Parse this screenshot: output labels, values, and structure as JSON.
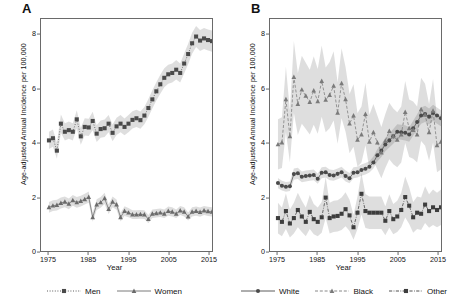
{
  "figure": {
    "panels": [
      {
        "id": "A",
        "label": "A",
        "xlabel": "Year",
        "ylabel": "Age-adjusted Annual Incidence per 100,000"
      },
      {
        "id": "B",
        "label": "B",
        "xlabel": "Year",
        "ylabel": "Age-adjusted Annual Incidence per 100,000"
      }
    ]
  },
  "legends": {
    "panel_a": [
      {
        "label": "Men",
        "marker": "square",
        "line": "dotted",
        "color": "#4a4a4a"
      },
      {
        "label": "Women",
        "marker": "triangle",
        "line": "solid",
        "color": "#6b6b6b"
      }
    ],
    "panel_b": [
      {
        "label": "White",
        "marker": "circle",
        "line": "solid",
        "color": "#4a4a4a"
      },
      {
        "label": "Black",
        "marker": "triangle",
        "line": "dashed",
        "color": "#7a7a7a"
      },
      {
        "label": "Other",
        "marker": "square",
        "line": "dash-dot",
        "color": "#3d3d3d"
      }
    ]
  },
  "chart_data": [
    {
      "type": "line",
      "panel": "A",
      "title": "A",
      "xlabel": "Year",
      "ylabel": "Age-adjusted Annual Incidence per 100,000",
      "xlim": [
        1973,
        2016
      ],
      "ylim": [
        0,
        8.6
      ],
      "xticks": [
        1975,
        1985,
        1995,
        2005,
        2015
      ],
      "yticks": [
        0,
        2,
        4,
        6,
        8
      ],
      "grid": false,
      "legend_position": "bottom",
      "x": [
        1975,
        1976,
        1977,
        1978,
        1979,
        1980,
        1981,
        1982,
        1983,
        1984,
        1985,
        1986,
        1987,
        1988,
        1989,
        1990,
        1991,
        1992,
        1993,
        1994,
        1995,
        1996,
        1997,
        1998,
        1999,
        2000,
        2001,
        2002,
        2003,
        2004,
        2005,
        2006,
        2007,
        2008,
        2009,
        2010,
        2011,
        2012,
        2013,
        2014,
        2015,
        2016
      ],
      "series": [
        {
          "name": "Men",
          "marker": "square",
          "line": "dotted",
          "color": "#4a4a4a",
          "values": [
            4.1,
            4.18,
            3.72,
            4.72,
            4.42,
            4.48,
            4.42,
            4.88,
            4.25,
            4.6,
            4.58,
            4.82,
            4.35,
            4.52,
            4.55,
            4.72,
            4.38,
            4.62,
            4.72,
            4.6,
            4.72,
            4.86,
            4.92,
            4.85,
            5.02,
            5.3,
            5.62,
            5.92,
            6.18,
            6.42,
            6.55,
            6.6,
            6.72,
            6.6,
            6.95,
            7.3,
            7.7,
            7.95,
            7.8,
            7.88,
            7.82,
            7.78
          ],
          "ci_lower": [
            3.78,
            3.86,
            3.42,
            4.38,
            4.1,
            4.16,
            4.1,
            4.54,
            3.94,
            4.28,
            4.26,
            4.48,
            4.04,
            4.2,
            4.23,
            4.4,
            4.07,
            4.3,
            4.4,
            4.29,
            4.4,
            4.54,
            4.6,
            4.53,
            4.7,
            4.97,
            5.28,
            5.58,
            5.83,
            6.07,
            6.2,
            6.25,
            6.36,
            6.25,
            6.58,
            6.92,
            7.31,
            7.56,
            7.41,
            7.49,
            7.43,
            7.39
          ],
          "ci_upper": [
            4.42,
            4.5,
            4.02,
            5.06,
            4.74,
            4.8,
            4.74,
            5.22,
            4.56,
            4.92,
            4.9,
            5.16,
            4.66,
            4.84,
            4.87,
            5.04,
            4.69,
            4.94,
            5.04,
            4.91,
            5.04,
            5.18,
            5.24,
            5.17,
            5.34,
            5.63,
            5.96,
            6.26,
            6.53,
            6.77,
            6.9,
            6.95,
            7.08,
            6.95,
            7.32,
            7.68,
            8.09,
            8.34,
            8.19,
            8.27,
            8.21,
            8.17
          ]
        },
        {
          "name": "Women",
          "marker": "triangle",
          "line": "solid",
          "color": "#6b6b6b",
          "values": [
            1.62,
            1.68,
            1.7,
            1.78,
            1.82,
            1.75,
            1.88,
            1.8,
            1.85,
            1.92,
            2.0,
            1.25,
            1.72,
            1.8,
            1.95,
            1.55,
            1.82,
            1.72,
            1.25,
            1.48,
            1.42,
            1.35,
            1.35,
            1.36,
            1.35,
            1.18,
            1.38,
            1.4,
            1.42,
            1.38,
            1.48,
            1.45,
            1.38,
            1.5,
            1.45,
            1.28,
            1.45,
            1.48,
            1.44,
            1.5,
            1.47,
            1.45
          ],
          "ci_lower": [
            1.42,
            1.48,
            1.5,
            1.58,
            1.62,
            1.55,
            1.68,
            1.6,
            1.65,
            1.72,
            1.79,
            1.08,
            1.52,
            1.6,
            1.74,
            1.37,
            1.62,
            1.53,
            1.09,
            1.3,
            1.25,
            1.19,
            1.19,
            1.2,
            1.19,
            1.03,
            1.22,
            1.24,
            1.26,
            1.22,
            1.31,
            1.28,
            1.22,
            1.33,
            1.28,
            1.13,
            1.28,
            1.31,
            1.27,
            1.33,
            1.3,
            1.28
          ],
          "ci_upper": [
            1.82,
            1.88,
            1.9,
            1.98,
            2.02,
            1.95,
            2.08,
            2.0,
            2.05,
            2.12,
            2.21,
            1.42,
            1.92,
            2.0,
            2.16,
            1.73,
            2.02,
            1.91,
            1.41,
            1.66,
            1.59,
            1.51,
            1.51,
            1.52,
            1.51,
            1.33,
            1.54,
            1.56,
            1.58,
            1.54,
            1.65,
            1.62,
            1.54,
            1.67,
            1.62,
            1.43,
            1.62,
            1.65,
            1.61,
            1.67,
            1.64,
            1.62
          ]
        }
      ]
    },
    {
      "type": "line",
      "panel": "B",
      "title": "B",
      "xlabel": "Year",
      "ylabel": "Age-adjusted Annual Incidence per 100,000",
      "xlim": [
        1973,
        2016
      ],
      "ylim": [
        0,
        8.6
      ],
      "xticks": [
        1975,
        1985,
        1995,
        2005,
        2015
      ],
      "yticks": [
        0,
        2,
        4,
        6,
        8
      ],
      "grid": false,
      "legend_position": "bottom",
      "x": [
        1975,
        1976,
        1977,
        1978,
        1979,
        1980,
        1981,
        1982,
        1983,
        1984,
        1985,
        1986,
        1987,
        1988,
        1989,
        1990,
        1991,
        1992,
        1993,
        1994,
        1995,
        1996,
        1997,
        1998,
        1999,
        2000,
        2001,
        2002,
        2003,
        2004,
        2005,
        2006,
        2007,
        2008,
        2009,
        2010,
        2011,
        2012,
        2013,
        2014,
        2015,
        2016
      ],
      "series": [
        {
          "name": "White",
          "marker": "circle",
          "line": "solid",
          "color": "#4a4a4a",
          "values": [
            2.52,
            2.42,
            2.38,
            2.4,
            2.85,
            2.88,
            2.75,
            2.78,
            2.8,
            2.82,
            2.68,
            2.9,
            2.92,
            2.82,
            2.8,
            2.86,
            2.92,
            2.78,
            2.7,
            2.9,
            2.92,
            3.0,
            3.05,
            3.12,
            3.28,
            3.55,
            3.72,
            3.95,
            4.1,
            4.25,
            4.42,
            4.4,
            4.38,
            4.32,
            4.55,
            4.78,
            5.02,
            5.08,
            4.98,
            5.12,
            5.02,
            4.92
          ],
          "ci_lower": [
            2.33,
            2.24,
            2.2,
            2.22,
            2.64,
            2.67,
            2.55,
            2.58,
            2.6,
            2.62,
            2.49,
            2.7,
            2.72,
            2.62,
            2.6,
            2.66,
            2.72,
            2.58,
            2.51,
            2.7,
            2.72,
            2.79,
            2.84,
            2.91,
            3.06,
            3.32,
            3.48,
            3.7,
            3.84,
            3.98,
            4.14,
            4.12,
            4.1,
            4.05,
            4.27,
            4.49,
            4.72,
            4.78,
            4.68,
            4.82,
            4.72,
            4.62
          ],
          "ci_upper": [
            2.71,
            2.6,
            2.56,
            2.58,
            3.06,
            3.09,
            2.95,
            2.98,
            3.0,
            3.02,
            2.87,
            3.1,
            3.12,
            3.02,
            3.0,
            3.06,
            3.12,
            2.98,
            2.89,
            3.1,
            3.12,
            3.21,
            3.26,
            3.33,
            3.5,
            3.78,
            3.96,
            4.2,
            4.36,
            4.52,
            4.7,
            4.68,
            4.66,
            4.59,
            4.83,
            5.07,
            5.32,
            5.38,
            5.28,
            5.42,
            5.32,
            5.22
          ]
        },
        {
          "name": "Black",
          "marker": "triangle",
          "line": "dashed",
          "color": "#7a7a7a",
          "values": [
            3.95,
            4.02,
            5.62,
            4.25,
            6.45,
            5.45,
            5.98,
            5.75,
            5.52,
            5.95,
            5.55,
            6.3,
            5.6,
            5.78,
            6.12,
            5.12,
            6.22,
            5.62,
            4.72,
            5.02,
            4.12,
            4.32,
            5.08,
            4.05,
            4.4,
            4.02,
            3.65,
            4.08,
            4.45,
            4.25,
            4.12,
            4.32,
            5.15,
            4.55,
            4.48,
            4.32,
            5.25,
            5.05,
            4.4,
            5.2,
            3.92,
            4.05
          ],
          "ci_lower": [
            3.02,
            3.08,
            4.4,
            3.28,
            5.12,
            4.3,
            4.72,
            4.52,
            4.32,
            4.68,
            4.35,
            4.98,
            4.4,
            4.55,
            4.84,
            3.98,
            4.92,
            4.42,
            3.62,
            3.86,
            3.12,
            3.28,
            3.92,
            3.05,
            3.35,
            3.02,
            2.7,
            3.08,
            3.4,
            3.22,
            3.1,
            3.28,
            4.0,
            3.48,
            3.42,
            3.28,
            4.08,
            3.9,
            3.35,
            4.02,
            2.92,
            3.02
          ],
          "ci_upper": [
            4.88,
            4.96,
            6.84,
            5.22,
            7.78,
            6.6,
            7.24,
            6.98,
            6.72,
            7.22,
            6.75,
            7.62,
            6.8,
            7.01,
            7.4,
            6.26,
            7.52,
            6.82,
            5.82,
            6.18,
            5.12,
            5.36,
            6.24,
            5.05,
            5.45,
            5.02,
            4.6,
            5.08,
            5.5,
            5.28,
            5.14,
            5.36,
            6.3,
            5.62,
            5.54,
            5.36,
            6.42,
            6.2,
            5.45,
            6.38,
            4.92,
            5.08
          ]
        },
        {
          "name": "Other",
          "marker": "square",
          "line": "dash-dot",
          "color": "#3d3d3d",
          "values": [
            1.22,
            1.08,
            1.48,
            1.02,
            1.22,
            1.52,
            1.28,
            1.08,
            1.45,
            1.18,
            1.08,
            1.25,
            1.98,
            1.22,
            1.28,
            1.3,
            1.38,
            1.55,
            1.32,
            0.88,
            1.42,
            2.12,
            1.48,
            1.42,
            1.42,
            1.42,
            1.42,
            1.12,
            1.48,
            1.18,
            1.28,
            1.52,
            2.0,
            1.68,
            1.25,
            1.42,
            1.38,
            1.72,
            1.48,
            1.62,
            1.52,
            1.62
          ],
          "ci_lower": [
            0.65,
            0.55,
            0.82,
            0.5,
            0.65,
            0.88,
            0.7,
            0.55,
            0.82,
            0.62,
            0.55,
            0.68,
            1.22,
            0.65,
            0.7,
            0.72,
            0.78,
            0.92,
            0.74,
            0.42,
            0.82,
            1.35,
            0.85,
            0.82,
            0.82,
            0.82,
            0.82,
            0.58,
            0.86,
            0.62,
            0.7,
            0.88,
            1.24,
            1.0,
            0.68,
            0.82,
            0.78,
            1.04,
            0.86,
            0.96,
            0.88,
            0.96
          ],
          "ci_upper": [
            1.79,
            1.61,
            2.14,
            1.54,
            1.79,
            2.16,
            1.86,
            1.61,
            2.08,
            1.74,
            1.61,
            1.82,
            2.74,
            1.79,
            1.86,
            1.88,
            1.98,
            2.18,
            1.9,
            1.34,
            2.02,
            2.89,
            2.11,
            2.02,
            2.02,
            2.02,
            2.02,
            1.66,
            2.1,
            1.74,
            1.86,
            2.16,
            2.76,
            2.36,
            1.82,
            2.02,
            1.98,
            2.4,
            2.1,
            2.28,
            2.16,
            2.28
          ]
        }
      ]
    }
  ]
}
